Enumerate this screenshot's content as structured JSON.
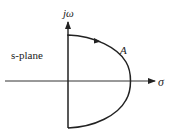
{
  "diagram": {
    "type": "nyquist-contour",
    "plane_label": "s-plane",
    "vertical_axis_label": "jω",
    "horizontal_axis_label": "σ",
    "contour_label": "A",
    "colors": {
      "line": "#222222",
      "background": "#ffffff"
    }
  }
}
